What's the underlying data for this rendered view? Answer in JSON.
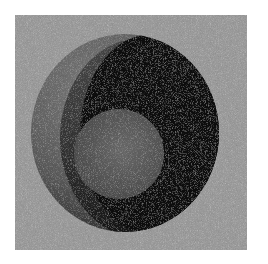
{
  "image": {
    "description": "Abstract grayscale artwork: noisy textured square with a large dark disc containing a black crescent and a lighter inner disc",
    "palette": {
      "margin": "#ffffff",
      "square_background": "#9a9a9a",
      "outer_disc": "#6e6e6e",
      "dark_band": "#3a3a3a",
      "crescent": "#0c0c0c",
      "inner_disc": "#5e5e5e"
    },
    "geometry": {
      "square": {
        "x": 15,
        "y": 15,
        "width": 232,
        "height": 235
      },
      "outer_disc": {
        "cx": 125,
        "cy": 133,
        "rx": 94,
        "ry": 99
      },
      "crescent_disc": {
        "cx": 148,
        "cy": 130,
        "rx": 71,
        "ry": 99
      },
      "inner_disc": {
        "cx": 119,
        "cy": 154,
        "r": 45
      }
    }
  }
}
